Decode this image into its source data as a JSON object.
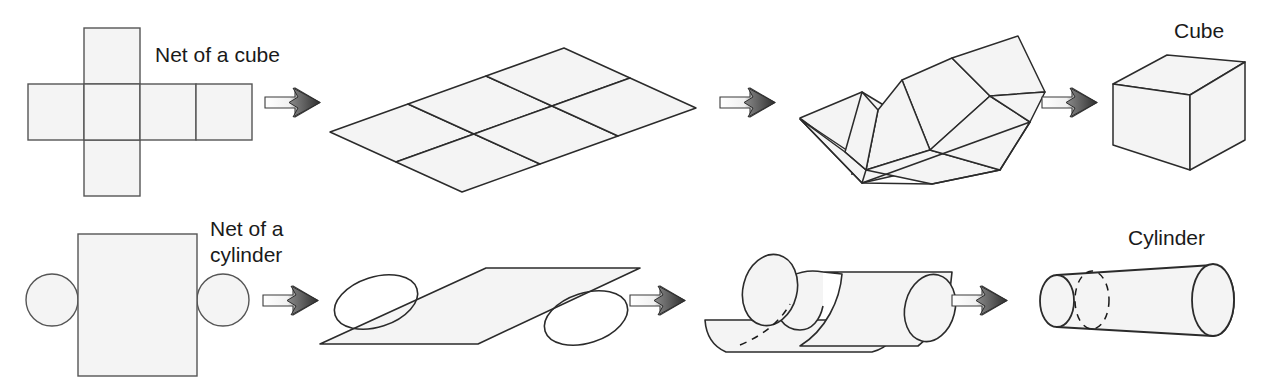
{
  "figure": {
    "title_hidden": "",
    "canvas": {
      "width": 1270,
      "height": 386
    },
    "style": {
      "face_fill": "#f4f4f4",
      "stroke": "#2b2b2b",
      "stroke_light": "#555555",
      "dash_stroke": "#1a1a1a",
      "arrow_light": "#ffffff",
      "arrow_dark": "#4a4a4a",
      "text_color": "#1a1a1a",
      "background": "#ffffff"
    },
    "labels": {
      "net_of_a_cube": "Net of a cube",
      "cube": "Cube",
      "net_of_a_cylinder_line1": "Net of a",
      "net_of_a_cylinder_line2": "cylinder",
      "cylinder": "Cylinder"
    },
    "rows": [
      {
        "name": "cube-sequence",
        "stages": [
          {
            "name": "cube-net-flat",
            "caption": "Net of a cube"
          },
          {
            "name": "cube-net-perspective",
            "caption": ""
          },
          {
            "name": "cube-net-folding",
            "caption": ""
          },
          {
            "name": "cube-solid",
            "caption": "Cube"
          }
        ],
        "arrows": 3
      },
      {
        "name": "cylinder-sequence",
        "stages": [
          {
            "name": "cylinder-net-flat",
            "caption": "Net of a cylinder"
          },
          {
            "name": "cylinder-net-perspective",
            "caption": ""
          },
          {
            "name": "cylinder-net-rolling",
            "caption": ""
          },
          {
            "name": "cylinder-solid",
            "caption": "Cylinder"
          }
        ],
        "arrows": 3
      }
    ],
    "cube_net_flat": {
      "cell": 56,
      "origin_x": 28,
      "origin_y": 28,
      "columns": 4,
      "rows": 3,
      "cross_column_index": 1
    },
    "cylinder_net_flat": {
      "rect": {
        "x": 78,
        "y": 234,
        "width": 119,
        "height": 142
      },
      "circle_radius": 26,
      "left_circle_center": {
        "x": 52,
        "y": 300
      },
      "right_circle_center": {
        "x": 223,
        "y": 300
      }
    },
    "arrow_positions": [
      {
        "name": "arrow-1",
        "x": 265,
        "y": 90
      },
      {
        "name": "arrow-2",
        "x": 720,
        "y": 90
      },
      {
        "name": "arrow-3",
        "x": 1042,
        "y": 90
      },
      {
        "name": "arrow-4",
        "x": 263,
        "y": 288
      },
      {
        "name": "arrow-5",
        "x": 630,
        "y": 288
      },
      {
        "name": "arrow-6",
        "x": 952,
        "y": 288
      }
    ]
  }
}
